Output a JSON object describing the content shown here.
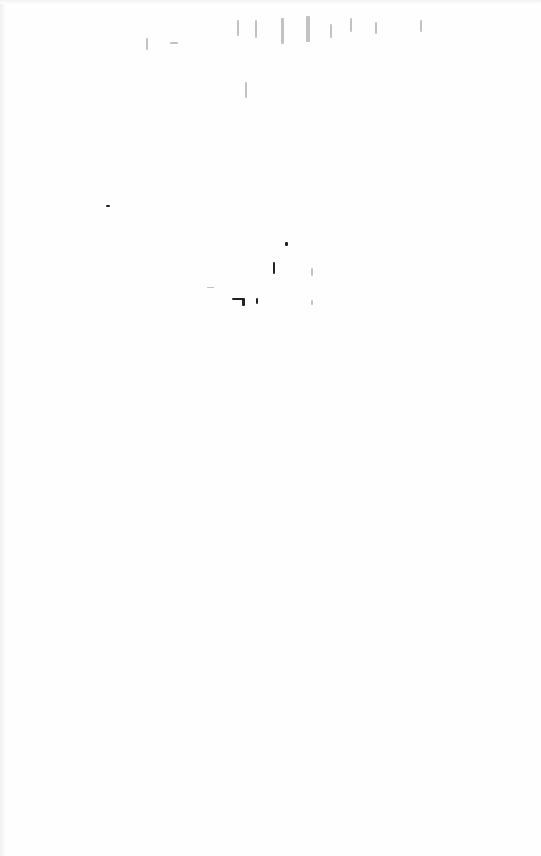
{
  "document": {
    "type": "scanned-blank-page",
    "text": "",
    "background_color": "#fefefe",
    "marks": [
      {
        "x": 146,
        "y": 38,
        "w": 2,
        "h": 12,
        "faint": true
      },
      {
        "x": 170,
        "y": 42,
        "w": 8,
        "h": 2,
        "faint": true
      },
      {
        "x": 237,
        "y": 20,
        "w": 2,
        "h": 16,
        "faint": true
      },
      {
        "x": 255,
        "y": 20,
        "w": 2,
        "h": 18,
        "faint": true
      },
      {
        "x": 281,
        "y": 18,
        "w": 3,
        "h": 26,
        "faint": true
      },
      {
        "x": 306,
        "y": 16,
        "w": 4,
        "h": 26,
        "faint": true
      },
      {
        "x": 330,
        "y": 24,
        "w": 2,
        "h": 14,
        "faint": true
      },
      {
        "x": 350,
        "y": 18,
        "w": 2,
        "h": 14,
        "faint": true
      },
      {
        "x": 375,
        "y": 22,
        "w": 2,
        "h": 12,
        "faint": true
      },
      {
        "x": 420,
        "y": 20,
        "w": 2,
        "h": 12,
        "faint": true
      },
      {
        "x": 245,
        "y": 82,
        "w": 2,
        "h": 16,
        "faint": true
      },
      {
        "x": 106,
        "y": 205,
        "w": 4,
        "h": 2,
        "faint": false
      },
      {
        "x": 285,
        "y": 242,
        "w": 3,
        "h": 4,
        "faint": false
      },
      {
        "x": 273,
        "y": 262,
        "w": 2,
        "h": 12,
        "faint": false
      },
      {
        "x": 311,
        "y": 268,
        "w": 2,
        "h": 8,
        "faint": true
      },
      {
        "x": 207,
        "y": 287,
        "w": 7,
        "h": 1,
        "faint": true
      },
      {
        "x": 232,
        "y": 298,
        "w": 12,
        "h": 2,
        "faint": false
      },
      {
        "x": 242,
        "y": 298,
        "w": 3,
        "h": 8,
        "faint": false
      },
      {
        "x": 256,
        "y": 298,
        "w": 2,
        "h": 6,
        "faint": false
      },
      {
        "x": 311,
        "y": 300,
        "w": 2,
        "h": 5,
        "faint": true
      }
    ]
  }
}
